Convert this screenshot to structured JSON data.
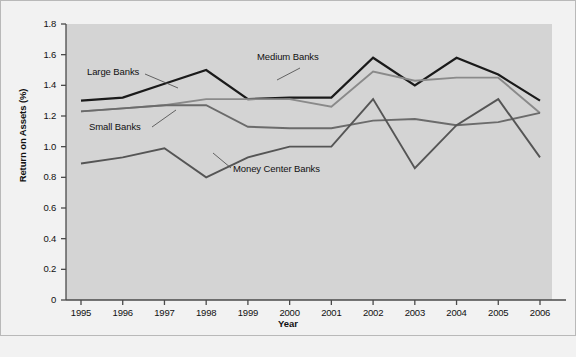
{
  "chart_data": {
    "type": "line",
    "title": "",
    "xlabel": "Year",
    "ylabel": "Return on Assets (%)",
    "x": [
      1995,
      1996,
      1997,
      1998,
      1999,
      2000,
      2001,
      2002,
      2003,
      2004,
      2005,
      2006
    ],
    "categories": [
      "1995",
      "1996",
      "1997",
      "1998",
      "1999",
      "2000",
      "2001",
      "2002",
      "2003",
      "2004",
      "2005",
      "2006"
    ],
    "xlim": [
      1995,
      2006
    ],
    "ylim": [
      0,
      1.8
    ],
    "ytick_values": [
      0,
      0.2,
      0.4,
      0.6,
      0.8,
      1.0,
      1.2,
      1.4,
      1.6,
      1.8
    ],
    "ytick_labels": [
      "0",
      "0.2",
      "0.4",
      "0.6",
      "0.8",
      "1.0",
      "1.2",
      "1.4",
      "1.6",
      "1.8"
    ],
    "grid": false,
    "legend_position": "inline-annotations",
    "plot_background": "#d4d4d4",
    "figure_background": "#f2f2f2",
    "series": [
      {
        "name": "Large Banks",
        "color": "#1a1a1a",
        "values": [
          1.3,
          1.32,
          1.41,
          1.5,
          1.31,
          1.32,
          1.32,
          1.58,
          1.4,
          1.58,
          1.47,
          1.3
        ]
      },
      {
        "name": "Medium Banks",
        "color": "#8a8a8a",
        "values": [
          1.23,
          1.25,
          1.27,
          1.31,
          1.31,
          1.31,
          1.26,
          1.49,
          1.43,
          1.45,
          1.45,
          1.22
        ]
      },
      {
        "name": "Small Banks",
        "color": "#6b6b6b",
        "values": [
          1.23,
          1.25,
          1.27,
          1.27,
          1.13,
          1.12,
          1.12,
          1.17,
          1.18,
          1.14,
          1.16,
          1.22
        ]
      },
      {
        "name": "Money Center Banks",
        "color": "#555555",
        "values": [
          0.89,
          0.93,
          0.99,
          0.8,
          0.93,
          1.0,
          1.0,
          1.31,
          0.86,
          1.14,
          1.31,
          0.93
        ]
      }
    ],
    "annotations": [
      {
        "text": "Large Banks",
        "series": "Large Banks"
      },
      {
        "text": "Medium Banks",
        "series": "Medium Banks"
      },
      {
        "text": "Small Banks",
        "series": "Small Banks"
      },
      {
        "text": "Money Center Banks",
        "series": "Money Center Banks"
      }
    ]
  }
}
